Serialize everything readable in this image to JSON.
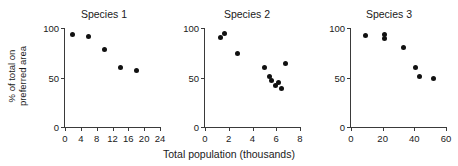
{
  "figure": {
    "ylabel_line1": "% of total on",
    "ylabel_line2": "preferred area",
    "xlabel": "Total population (thousands)"
  },
  "chart_data": [
    {
      "type": "scatter",
      "title": "Species 1",
      "xlabel": "Total population (thousands)",
      "ylabel": "% of total on preferred area",
      "xlim": [
        0,
        24
      ],
      "ylim": [
        0,
        100
      ],
      "xticks": [
        0,
        4,
        8,
        12,
        16,
        20,
        24
      ],
      "yticks": [
        0,
        50,
        100
      ],
      "grid": false,
      "legend": "none",
      "points": [
        {
          "x": 2,
          "y": 93
        },
        {
          "x": 6,
          "y": 91
        },
        {
          "x": 10,
          "y": 78
        },
        {
          "x": 14,
          "y": 60
        },
        {
          "x": 18,
          "y": 57
        }
      ]
    },
    {
      "type": "scatter",
      "title": "Species 2",
      "xlabel": "Total population (thousands)",
      "ylabel": "% of total on preferred area",
      "xlim": [
        0,
        8
      ],
      "ylim": [
        0,
        100
      ],
      "xticks": [
        0,
        2,
        4,
        6,
        8
      ],
      "yticks": [
        0,
        50,
        100
      ],
      "grid": false,
      "legend": "none",
      "points": [
        {
          "x": 1.3,
          "y": 90
        },
        {
          "x": 1.65,
          "y": 94
        },
        {
          "x": 2.7,
          "y": 74
        },
        {
          "x": 5.0,
          "y": 60
        },
        {
          "x": 5.4,
          "y": 51
        },
        {
          "x": 5.6,
          "y": 47
        },
        {
          "x": 5.95,
          "y": 42
        },
        {
          "x": 6.2,
          "y": 45
        },
        {
          "x": 6.45,
          "y": 39
        },
        {
          "x": 6.8,
          "y": 64
        }
      ]
    },
    {
      "type": "scatter",
      "title": "Species 3",
      "xlabel": "Total population (thousands)",
      "ylabel": "% of total on preferred area",
      "xlim": [
        0,
        60
      ],
      "ylim": [
        0,
        100
      ],
      "xticks": [
        0,
        20,
        40,
        60
      ],
      "yticks": [
        0,
        50,
        100
      ],
      "grid": false,
      "legend": "none",
      "points": [
        {
          "x": 9,
          "y": 92
        },
        {
          "x": 21,
          "y": 93
        },
        {
          "x": 21,
          "y": 89
        },
        {
          "x": 33,
          "y": 80
        },
        {
          "x": 41,
          "y": 60
        },
        {
          "x": 43.5,
          "y": 51
        },
        {
          "x": 52,
          "y": 49
        }
      ]
    }
  ]
}
